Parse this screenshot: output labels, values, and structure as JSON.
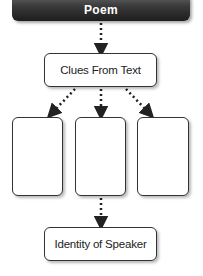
{
  "diagram": {
    "title": "Poem",
    "clues_node": "Clues From Text",
    "clue_boxes": [
      "",
      "",
      ""
    ],
    "result_node": "Identity of Speaker"
  },
  "colors": {
    "title_bg": "#2a2a2a",
    "title_text": "#ffffff",
    "border": "#333333",
    "connector": "#222222"
  }
}
